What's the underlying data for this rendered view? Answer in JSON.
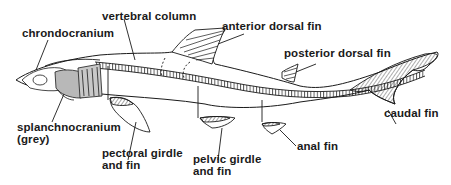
{
  "diagram": {
    "colors": {
      "background": "#ffffff",
      "line": "#1a1a1a",
      "grey_fill": "#b8b8b8"
    },
    "labels": {
      "chrondocranium": "chrondocranium",
      "vertebral_column": "vertebral column",
      "anterior_dorsal_fin": "anterior dorsal fin",
      "posterior_dorsal_fin": "posterior dorsal fin",
      "caudal_fin": "caudal fin",
      "anal_fin": "anal fin",
      "pelvic_girdle_line1": "pelvic girdle",
      "pelvic_girdle_line2": "and fin",
      "pectoral_girdle_line1": "pectoral girdle",
      "pectoral_girdle_line2": "and fin",
      "splanchnocranium_line1": "splanchnocranium",
      "splanchnocranium_line2": "(grey)"
    }
  }
}
